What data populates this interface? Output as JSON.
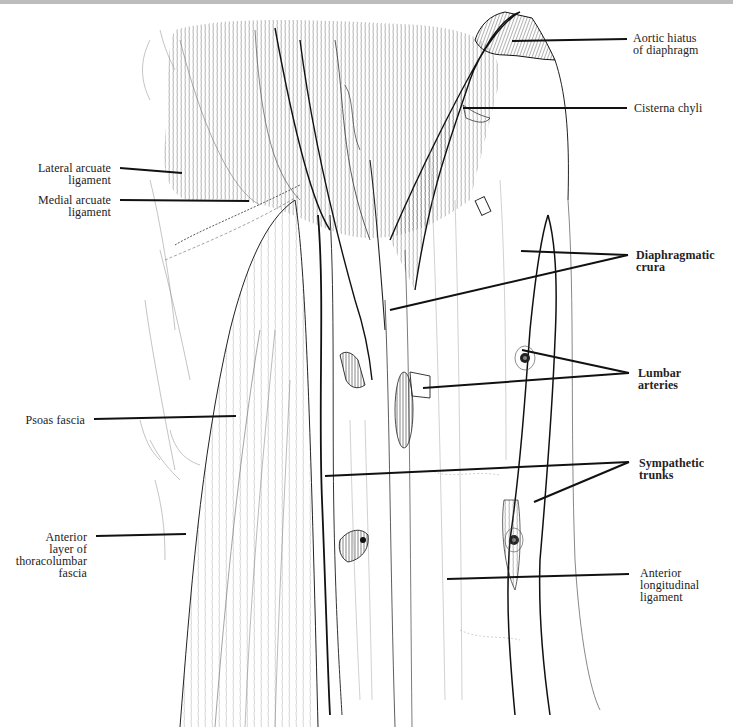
{
  "figure": {
    "type": "anatomical line drawing"
  },
  "labels": {
    "right": [
      {
        "id": "aortic-hiatus",
        "text": "Aortic hiatus\nof diaphragm",
        "bold": false
      },
      {
        "id": "cisterna-chyli",
        "text": "Cisterna chyli",
        "bold": false
      },
      {
        "id": "diaphragmatic-crura",
        "text": "Diaphragmatic\ncrura",
        "bold": true
      },
      {
        "id": "lumbar-arteries",
        "text": "Lumbar\narteries",
        "bold": true
      },
      {
        "id": "sympathetic-trunks",
        "text": "Sympathetic\ntrunks",
        "bold": true
      },
      {
        "id": "anterior-longitudinal-ligament",
        "text": "Anterior\nlongitudinal\nligament",
        "bold": false
      }
    ],
    "left": [
      {
        "id": "lateral-arcuate-ligament",
        "text": "Lateral arcuate\nligament",
        "bold": false
      },
      {
        "id": "medial-arcuate-ligament",
        "text": "Medial arcuate\nligament",
        "bold": false
      },
      {
        "id": "psoas-fascia",
        "text": "Psoas fascia",
        "bold": false
      },
      {
        "id": "anterior-layer-thoracolumbar-fascia",
        "text": "Anterior\nlayer of\nthoracolumbar\nfascia",
        "bold": false
      }
    ]
  },
  "colors": {
    "ink": "#1a1a1a",
    "background": "#ffffff",
    "topbar": "#bdbdbd"
  }
}
